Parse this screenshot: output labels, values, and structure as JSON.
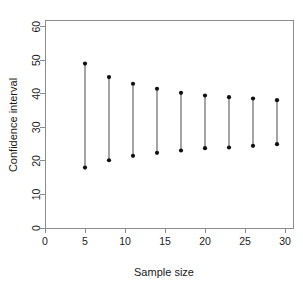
{
  "chart_data": {
    "type": "scatter",
    "title": "",
    "xlabel": "Sample size",
    "ylabel": "Confidence interval",
    "xlim": [
      0,
      31
    ],
    "ylim": [
      0,
      62
    ],
    "xticks": [
      0,
      5,
      10,
      15,
      20,
      25,
      30
    ],
    "yticks": [
      0,
      10,
      20,
      30,
      40,
      50,
      60
    ],
    "grid": false,
    "legend": false,
    "marker": "filled-circle",
    "x": [
      5,
      8,
      11,
      14,
      17,
      20,
      23,
      26,
      29
    ],
    "series": [
      {
        "name": "Lower limit",
        "values": [
          18.0,
          20.2,
          21.5,
          22.4,
          23.1,
          23.8,
          24.0,
          24.5,
          25.0
        ]
      },
      {
        "name": "Upper limit",
        "values": [
          49.0,
          45.0,
          43.0,
          41.5,
          40.3,
          39.5,
          39.0,
          38.6,
          38.1
        ]
      }
    ],
    "intervals": [
      {
        "sample_size": 5,
        "lower": 18.0,
        "upper": 49.0,
        "width": 31.0
      },
      {
        "sample_size": 8,
        "lower": 20.2,
        "upper": 45.0,
        "width": 24.8
      },
      {
        "sample_size": 11,
        "lower": 21.5,
        "upper": 43.0,
        "width": 21.5
      },
      {
        "sample_size": 14,
        "lower": 22.4,
        "upper": 41.5,
        "width": 19.1
      },
      {
        "sample_size": 17,
        "lower": 23.1,
        "upper": 40.3,
        "width": 17.2
      },
      {
        "sample_size": 20,
        "lower": 23.8,
        "upper": 39.5,
        "width": 15.7
      },
      {
        "sample_size": 23,
        "lower": 24.0,
        "upper": 39.0,
        "width": 15.0
      },
      {
        "sample_size": 26,
        "lower": 24.5,
        "upper": 38.6,
        "width": 14.1
      },
      {
        "sample_size": 29,
        "lower": 25.0,
        "upper": 38.1,
        "width": 13.1
      }
    ],
    "colors": {
      "line": "#5a5a5a",
      "dot": "#111111",
      "axis": "#8c8c8c",
      "text": "#1a1a1a",
      "background": "#ffffff"
    }
  }
}
